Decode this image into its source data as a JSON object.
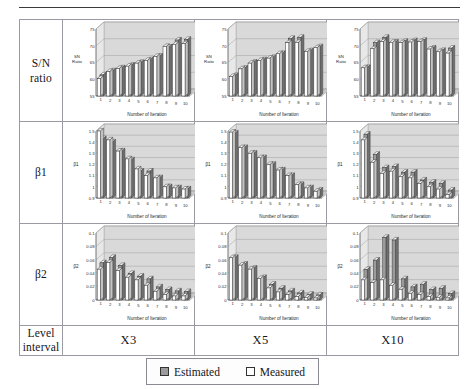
{
  "figure": {
    "row_labels": [
      "S/N ratio",
      "β1",
      "β2",
      "Level interval"
    ],
    "row_label_lines": {
      "sn": [
        "S/N",
        "ratio"
      ],
      "b1": [
        "β1"
      ],
      "b2": [
        "β2"
      ],
      "level": [
        "Level",
        "interval"
      ]
    },
    "columns": [
      "X3",
      "X5",
      "X10"
    ],
    "legend": {
      "items": [
        {
          "label": "Estimated",
          "color": "#9b9b9b"
        },
        {
          "label": "Measured",
          "color": "#ffffff"
        }
      ]
    },
    "colors": {
      "estimated": "#9b9b9b",
      "measured": "#ffffff",
      "bar_outline": "#3a3a3a",
      "plot_back": "#d9d9d9",
      "plot_floor": "#c9c9c9",
      "grid": "#9a9a9a",
      "border": "#9a9aa2"
    }
  },
  "chart_data": [
    {
      "id": "sn-x3",
      "type": "bar",
      "title": "",
      "ylabel": "SN Ratio",
      "xlabel": "Number of Iteration",
      "categories": [
        "1",
        "2",
        "3",
        "4",
        "5",
        "6",
        "7",
        "8",
        "9",
        "10"
      ],
      "yticks": [
        55,
        60,
        65,
        70,
        75
      ],
      "ylim": [
        55,
        75
      ],
      "grid": true,
      "legend_position": "external-bottom",
      "series": [
        {
          "name": "Estimated",
          "values": [
            60.6,
            61.8,
            62.7,
            63.5,
            64.3,
            65.1,
            66.2,
            68.9,
            71.0,
            71.2
          ]
        },
        {
          "name": "Measured",
          "values": [
            60.2,
            62.3,
            63.2,
            63.9,
            64.8,
            65.6,
            66.8,
            69.8,
            70.4,
            70.6
          ]
        }
      ]
    },
    {
      "id": "sn-x5",
      "type": "bar",
      "title": "",
      "ylabel": "SN Ratio",
      "xlabel": "Number of Iteration",
      "categories": [
        "1",
        "2",
        "3",
        "4",
        "5",
        "6",
        "7",
        "8",
        "9",
        "10"
      ],
      "yticks": [
        55,
        60,
        65,
        70,
        75
      ],
      "ylim": [
        55,
        75
      ],
      "grid": true,
      "legend_position": "external-bottom",
      "series": [
        {
          "name": "Estimated",
          "values": [
            60.4,
            62.6,
            64.4,
            65.1,
            65.8,
            67.0,
            71.5,
            71.8,
            67.8,
            69.0
          ]
        },
        {
          "name": "Measured",
          "values": [
            60.8,
            63.1,
            64.8,
            65.6,
            66.3,
            67.6,
            70.9,
            71.0,
            68.3,
            69.4
          ]
        }
      ]
    },
    {
      "id": "sn-x10",
      "type": "bar",
      "title": "",
      "ylabel": "SN Ratio",
      "xlabel": "Number of Iteration",
      "categories": [
        "1",
        "2",
        "3",
        "4",
        "5",
        "6",
        "7",
        "8",
        "9",
        "10"
      ],
      "yticks": [
        55,
        60,
        65,
        70,
        75
      ],
      "ylim": [
        55,
        75
      ],
      "grid": true,
      "legend_position": "external-bottom",
      "series": [
        {
          "name": "Estimated",
          "values": [
            62.8,
            70.2,
            71.8,
            70.4,
            70.6,
            70.8,
            70.9,
            68.6,
            67.9,
            68.6
          ]
        },
        {
          "name": "Measured",
          "values": [
            63.4,
            69.1,
            71.2,
            71.0,
            70.9,
            71.1,
            71.2,
            69.0,
            68.2,
            67.8
          ]
        }
      ]
    },
    {
      "id": "b1-x3",
      "type": "bar",
      "title": "",
      "ylabel": "β1",
      "xlabel": "Number of Iteration",
      "categories": [
        "1",
        "2",
        "3",
        "4",
        "5",
        "6",
        "7",
        "8",
        "9",
        "10"
      ],
      "yticks": [
        0.9,
        1.0,
        1.1,
        1.2,
        1.3,
        1.4,
        1.5
      ],
      "ylim": [
        0.9,
        1.5
      ],
      "grid": true,
      "legend_position": "external-bottom",
      "series": [
        {
          "name": "Estimated",
          "values": [
            1.41,
            1.38,
            1.3,
            1.22,
            1.12,
            1.12,
            1.06,
            0.98,
            0.97,
            0.96
          ]
        },
        {
          "name": "Measured",
          "values": [
            1.5,
            1.42,
            1.32,
            1.25,
            1.16,
            1.1,
            1.08,
            1.0,
            0.99,
            0.98
          ]
        }
      ]
    },
    {
      "id": "b1-x5",
      "type": "bar",
      "title": "",
      "ylabel": "β1",
      "xlabel": "Number of Iteration",
      "categories": [
        "1",
        "2",
        "3",
        "4",
        "5",
        "6",
        "7",
        "8",
        "9",
        "10"
      ],
      "yticks": [
        0.9,
        1.0,
        1.1,
        1.2,
        1.3,
        1.4,
        1.5
      ],
      "ylim": [
        0.9,
        1.5
      ],
      "grid": true,
      "legend_position": "external-bottom",
      "series": [
        {
          "name": "Estimated",
          "values": [
            1.46,
            1.33,
            1.28,
            1.24,
            1.18,
            1.13,
            1.08,
            1.0,
            0.97,
            0.95
          ]
        },
        {
          "name": "Measured",
          "values": [
            1.49,
            1.35,
            1.3,
            1.26,
            1.2,
            1.15,
            1.1,
            1.02,
            0.99,
            0.96
          ]
        }
      ]
    },
    {
      "id": "b1-x10",
      "type": "bar",
      "title": "",
      "ylabel": "β1",
      "xlabel": "Number of Iteration",
      "categories": [
        "1",
        "2",
        "3",
        "4",
        "5",
        "6",
        "7",
        "8",
        "9",
        "10"
      ],
      "yticks": [
        0.9,
        1.0,
        1.1,
        1.2,
        1.3,
        1.4,
        1.5
      ],
      "ylim": [
        0.9,
        1.5
      ],
      "grid": true,
      "legend_position": "external-bottom",
      "series": [
        {
          "name": "Estimated",
          "values": [
            1.45,
            1.27,
            1.15,
            1.16,
            1.11,
            1.11,
            1.04,
            1.02,
            1.01,
            0.95
          ]
        },
        {
          "name": "Measured",
          "values": [
            1.42,
            1.22,
            1.12,
            1.14,
            1.09,
            1.08,
            1.03,
            1.0,
            0.98,
            0.93
          ]
        }
      ]
    },
    {
      "id": "b2-x3",
      "type": "bar",
      "title": "",
      "ylabel": "β2",
      "xlabel": "Number of Iteration",
      "categories": [
        "1",
        "2",
        "3",
        "4",
        "5",
        "6",
        "7",
        "8",
        "9",
        "10"
      ],
      "yticks": [
        0,
        0.02,
        0.04,
        0.06,
        0.08,
        0.1
      ],
      "ylim": [
        0,
        0.1
      ],
      "grid": true,
      "legend_position": "external-bottom",
      "series": [
        {
          "name": "Estimated",
          "values": [
            0.052,
            0.06,
            0.048,
            0.036,
            0.032,
            0.028,
            0.016,
            0.012,
            0.01,
            0.009
          ]
        },
        {
          "name": "Measured",
          "values": [
            0.046,
            0.056,
            0.044,
            0.034,
            0.03,
            0.022,
            0.013,
            0.008,
            0.006,
            0.006
          ]
        }
      ]
    },
    {
      "id": "b2-x5",
      "type": "bar",
      "title": "",
      "ylabel": "β2",
      "xlabel": "Number of Iteration",
      "categories": [
        "1",
        "2",
        "3",
        "4",
        "5",
        "6",
        "7",
        "8",
        "9",
        "10"
      ],
      "yticks": [
        0,
        0.02,
        0.04,
        0.06,
        0.08,
        0.1
      ],
      "ylim": [
        0,
        0.1
      ],
      "grid": true,
      "legend_position": "external-bottom",
      "series": [
        {
          "name": "Estimated",
          "values": [
            0.06,
            0.05,
            0.044,
            0.03,
            0.02,
            0.014,
            0.01,
            0.007,
            0.005,
            0.004
          ]
        },
        {
          "name": "Measured",
          "values": [
            0.063,
            0.052,
            0.046,
            0.032,
            0.018,
            0.012,
            0.008,
            0.005,
            0.004,
            0.003
          ]
        }
      ]
    },
    {
      "id": "b2-x10",
      "type": "bar",
      "title": "",
      "ylabel": "β2",
      "xlabel": "Number of Iteration",
      "categories": [
        "1",
        "2",
        "3",
        "4",
        "5",
        "6",
        "7",
        "8",
        "9",
        "10"
      ],
      "yticks": [
        0,
        0.02,
        0.04,
        0.06,
        0.08,
        0.1
      ],
      "ylim": [
        0,
        0.1
      ],
      "grid": true,
      "legend_position": "external-bottom",
      "series": [
        {
          "name": "Estimated",
          "values": [
            0.042,
            0.056,
            0.09,
            0.086,
            0.028,
            0.016,
            0.02,
            0.012,
            0.014,
            0.006
          ]
        },
        {
          "name": "Measured",
          "values": [
            0.03,
            0.026,
            0.03,
            0.022,
            0.016,
            0.01,
            0.008,
            0.005,
            0.004,
            0.003
          ]
        }
      ]
    }
  ]
}
